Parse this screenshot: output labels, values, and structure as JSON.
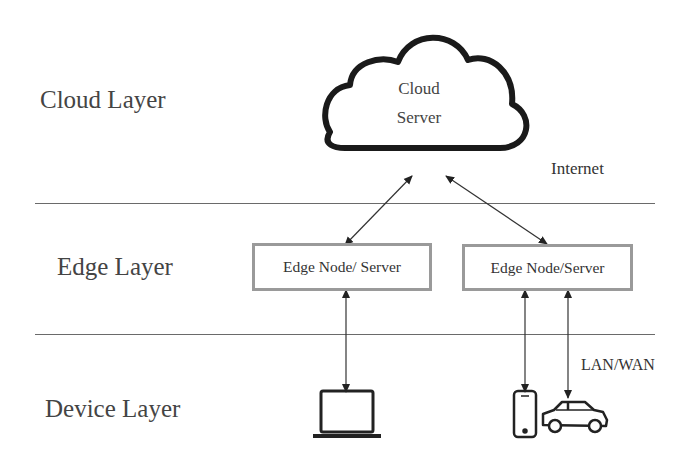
{
  "diagram": {
    "layers": [
      {
        "id": "cloud",
        "label": "Cloud Layer"
      },
      {
        "id": "edge",
        "label": "Edge Layer"
      },
      {
        "id": "device",
        "label": "Device Layer"
      }
    ],
    "cloud": {
      "line1": "Cloud",
      "line2": "Server"
    },
    "edge_nodes": [
      {
        "label": "Edge Node/ Server"
      },
      {
        "label": "Edge Node/Server"
      }
    ],
    "connections": {
      "internet_label": "Internet",
      "lan_label": "LAN/WAN"
    },
    "devices": [
      {
        "icon": "laptop-icon",
        "connected_to": "Edge Node/ Server"
      },
      {
        "icon": "smartphone-icon",
        "connected_to": "Edge Node/Server"
      },
      {
        "icon": "car-icon",
        "connected_to": "Edge Node/Server"
      }
    ]
  }
}
